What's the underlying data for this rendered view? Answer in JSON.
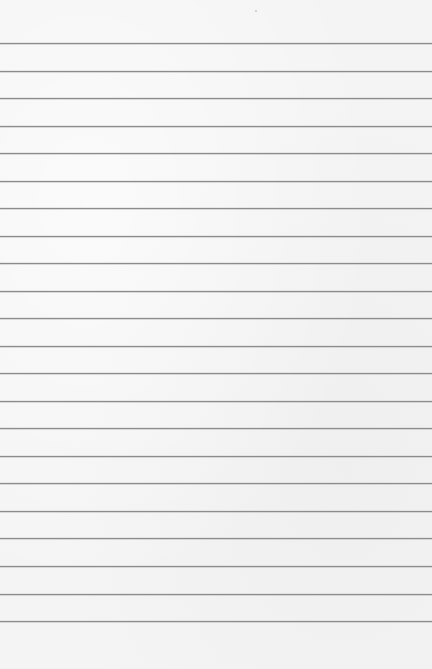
{
  "paper": {
    "background_color": "#f4f4f4",
    "line_color": "#8c8c8c",
    "line_count": 22,
    "line_positions_y": [
      43,
      71,
      98,
      126,
      153,
      181,
      208,
      236,
      263,
      291,
      318,
      346,
      373,
      401,
      428,
      456,
      483,
      511,
      538,
      566,
      594,
      621
    ]
  }
}
